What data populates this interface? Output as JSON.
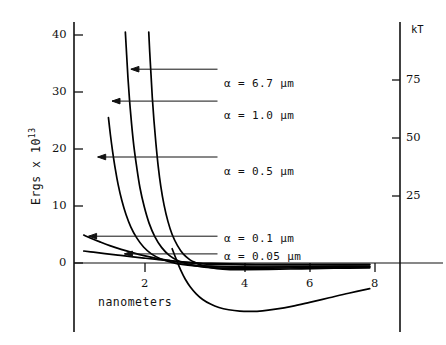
{
  "chart_data": {
    "type": "line",
    "title": "",
    "xlabel": "nanometers",
    "ylabel": "Ergs x 10^13",
    "ylabel_base": "Ergs x 10",
    "ylabel_exp": "13",
    "y2label": "kT",
    "xlim": [
      0,
      9.2
    ],
    "ylim": [
      -9,
      43
    ],
    "y2lim": [
      -22,
      107
    ],
    "grid": false,
    "legend": "arrow-annotations-inside-plot",
    "xticks": [
      2,
      4,
      6,
      8
    ],
    "xtick_labels": [
      "2",
      "4",
      "6",
      "8"
    ],
    "yticks": [
      0,
      10,
      20,
      30,
      40
    ],
    "ytick_labels": [
      "0",
      "10",
      "20",
      "30",
      "40"
    ],
    "y2ticks": [
      25,
      50,
      75
    ],
    "y2tick_labels": [
      "25",
      "50",
      "75"
    ],
    "annotations": [
      {
        "label": "α = 6.7  μm",
        "alpha": 6.7,
        "unit": "μm",
        "arrow_to_x": 1.75,
        "arrow_to_y": 34.0,
        "text_x": 4.6,
        "text_y": 34.0
      },
      {
        "label": "α = 1.0  μm",
        "alpha": 1.0,
        "unit": "μm",
        "arrow_to_x": 1.17,
        "arrow_to_y": 28.4,
        "text_x": 4.6,
        "text_y": 28.4
      },
      {
        "label": "α = 0.5  μm",
        "alpha": 0.5,
        "unit": "μm",
        "arrow_to_x": 0.73,
        "arrow_to_y": 18.6,
        "text_x": 4.6,
        "text_y": 18.6
      },
      {
        "label": "α = 0.1  μm",
        "alpha": 0.1,
        "unit": "μm",
        "arrow_to_x": 0.45,
        "arrow_to_y": 4.7,
        "text_x": 4.6,
        "text_y": 4.7
      },
      {
        "label": "α = 0.05 μm",
        "alpha": 0.05,
        "unit": "μm",
        "arrow_to_x": 1.55,
        "arrow_to_y": 1.6,
        "text_x": 4.6,
        "text_y": 1.9
      }
    ],
    "series": [
      {
        "name": "α = 6.7 μm",
        "points": [
          [
            2.3,
            40.5
          ],
          [
            2.33,
            37.0
          ],
          [
            2.37,
            33.0
          ],
          [
            2.41,
            29.0
          ],
          [
            2.46,
            25.0
          ],
          [
            2.52,
            21.0
          ],
          [
            2.59,
            17.0
          ],
          [
            2.67,
            13.5
          ],
          [
            2.77,
            10.2
          ],
          [
            2.89,
            7.3
          ],
          [
            3.02,
            5.0
          ],
          [
            3.18,
            3.1
          ],
          [
            3.36,
            1.6
          ],
          [
            3.56,
            0.6
          ],
          [
            3.74,
            0.05
          ],
          [
            3.9,
            -0.35
          ],
          [
            4.1,
            -0.7
          ],
          [
            4.4,
            -1.0
          ],
          [
            4.8,
            -1.15
          ],
          [
            5.3,
            -1.18
          ],
          [
            6.0,
            -1.12
          ],
          [
            7.0,
            -1.02
          ],
          [
            8.0,
            -0.92
          ],
          [
            9.1,
            -0.85
          ]
        ]
      },
      {
        "name": "α = 1.0 μm",
        "points": [
          [
            1.58,
            40.5
          ],
          [
            1.62,
            36.5
          ],
          [
            1.66,
            32.5
          ],
          [
            1.71,
            28.5
          ],
          [
            1.77,
            24.5
          ],
          [
            1.84,
            20.6
          ],
          [
            1.93,
            16.8
          ],
          [
            2.03,
            13.2
          ],
          [
            2.16,
            9.9
          ],
          [
            2.31,
            7.0
          ],
          [
            2.49,
            4.6
          ],
          [
            2.7,
            2.7
          ],
          [
            2.94,
            1.3
          ],
          [
            3.22,
            0.35
          ],
          [
            3.5,
            -0.2
          ],
          [
            3.8,
            -0.55
          ],
          [
            4.2,
            -0.8
          ],
          [
            4.8,
            -0.92
          ],
          [
            5.6,
            -0.94
          ],
          [
            6.6,
            -0.88
          ],
          [
            7.7,
            -0.8
          ],
          [
            9.1,
            -0.72
          ]
        ]
      },
      {
        "name": "α = 0.5 μm",
        "points": [
          [
            1.06,
            25.5
          ],
          [
            1.12,
            22.5
          ],
          [
            1.19,
            19.5
          ],
          [
            1.27,
            16.5
          ],
          [
            1.36,
            13.7
          ],
          [
            1.47,
            11.0
          ],
          [
            1.6,
            8.5
          ],
          [
            1.75,
            6.3
          ],
          [
            1.93,
            4.4
          ],
          [
            2.14,
            2.8
          ],
          [
            2.38,
            1.6
          ],
          [
            2.66,
            0.75
          ],
          [
            2.98,
            0.15
          ],
          [
            3.32,
            -0.25
          ],
          [
            3.72,
            -0.5
          ],
          [
            4.2,
            -0.65
          ],
          [
            4.9,
            -0.72
          ],
          [
            5.8,
            -0.72
          ],
          [
            7.0,
            -0.66
          ],
          [
            8.3,
            -0.6
          ],
          [
            9.1,
            -0.57
          ]
        ]
      },
      {
        "name": "α = 0.1 μm",
        "points": [
          [
            0.3,
            4.9
          ],
          [
            0.5,
            4.4
          ],
          [
            0.8,
            3.7
          ],
          [
            1.1,
            3.05
          ],
          [
            1.45,
            2.4
          ],
          [
            1.8,
            1.82
          ],
          [
            2.15,
            1.3
          ],
          [
            2.5,
            0.86
          ],
          [
            2.85,
            0.5
          ],
          [
            3.2,
            0.22
          ],
          [
            3.55,
            0.02
          ],
          [
            3.95,
            -0.14
          ],
          [
            4.5,
            -0.26
          ],
          [
            5.3,
            -0.33
          ],
          [
            6.3,
            -0.35
          ],
          [
            7.5,
            -0.34
          ],
          [
            9.1,
            -0.32
          ]
        ]
      },
      {
        "name": "α = 0.05 μm",
        "points": [
          [
            0.3,
            2.1
          ],
          [
            0.6,
            1.9
          ],
          [
            0.95,
            1.65
          ],
          [
            1.35,
            1.38
          ],
          [
            1.75,
            1.12
          ],
          [
            2.15,
            0.86
          ],
          [
            2.55,
            0.62
          ],
          [
            2.95,
            0.4
          ],
          [
            3.35,
            0.2
          ],
          [
            3.75,
            0.04
          ],
          [
            4.2,
            -0.08
          ],
          [
            4.8,
            -0.17
          ],
          [
            5.6,
            -0.22
          ],
          [
            6.6,
            -0.24
          ],
          [
            7.8,
            -0.23
          ],
          [
            9.1,
            -0.22
          ]
        ]
      },
      {
        "name": "deep-attraction-curve",
        "points": [
          [
            3.02,
            2.5
          ],
          [
            3.15,
            0.6
          ],
          [
            3.28,
            -1.2
          ],
          [
            3.42,
            -2.8
          ],
          [
            3.58,
            -4.2
          ],
          [
            3.76,
            -5.4
          ],
          [
            3.96,
            -6.4
          ],
          [
            4.2,
            -7.2
          ],
          [
            4.46,
            -7.8
          ],
          [
            4.76,
            -8.2
          ],
          [
            5.1,
            -8.45
          ],
          [
            5.45,
            -8.5
          ],
          [
            5.8,
            -8.4
          ],
          [
            6.2,
            -8.1
          ],
          [
            6.7,
            -7.6
          ],
          [
            7.25,
            -6.9
          ],
          [
            7.85,
            -6.1
          ],
          [
            8.45,
            -5.3
          ],
          [
            9.1,
            -4.5
          ]
        ]
      },
      {
        "name": "upper-zero-baseline",
        "points": [
          [
            3.1,
            -0.05
          ],
          [
            4.0,
            -0.45
          ],
          [
            5.0,
            -0.62
          ],
          [
            6.2,
            -0.66
          ],
          [
            7.5,
            -0.62
          ],
          [
            9.1,
            -0.58
          ]
        ]
      }
    ]
  }
}
